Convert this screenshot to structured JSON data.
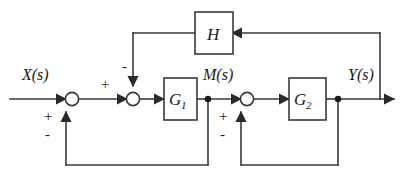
{
  "diagram": {
    "type": "control-system-block-diagram",
    "width": 406,
    "height": 181,
    "background_color": "#ffffff",
    "line_color": "#3a3a3a",
    "text_color": "#1a1a1a"
  },
  "signals": {
    "input": "X(s)",
    "intermediate": "M(s)",
    "output": "Y(s)"
  },
  "blocks": [
    {
      "id": "G1",
      "label": "G",
      "subscript": "1",
      "full_label": "G1"
    },
    {
      "id": "G2",
      "label": "G",
      "subscript": "2",
      "full_label": "G2"
    },
    {
      "id": "H",
      "label": "H",
      "subscript": "",
      "full_label": "H"
    }
  ],
  "summing_junctions": [
    {
      "id": "sum1",
      "inputs": [
        {
          "from": "X(s)",
          "sign": "+",
          "direction": "left"
        },
        {
          "from": "M(s)",
          "sign": "-",
          "direction": "bottom"
        }
      ],
      "sign_top_left": "+",
      "sign_bottom_left": "-"
    },
    {
      "id": "sum2",
      "inputs": [
        {
          "from": "sum1",
          "sign": "+",
          "direction": "left"
        },
        {
          "from": "H",
          "sign": "-",
          "direction": "top"
        }
      ],
      "sign_left": "+",
      "sign_top": "-"
    },
    {
      "id": "sum3",
      "inputs": [
        {
          "from": "M(s)",
          "sign": "+",
          "direction": "left"
        },
        {
          "from": "Y(s)",
          "sign": "-",
          "direction": "bottom"
        }
      ],
      "sign_top_left": "+",
      "sign_bottom_left": "-"
    }
  ],
  "signs": {
    "sum1_forward": "+",
    "sum1_feedback_plus": "+",
    "sum1_feedback_minus": "-",
    "sum2_forward": "+",
    "sum2_top": "-",
    "sum3_feedback_plus": "+",
    "sum3_feedback_minus": "-"
  },
  "branch_nodes": [
    {
      "id": "node_M",
      "signal": "M(s)"
    },
    {
      "id": "node_Y",
      "signal": "Y(s)"
    }
  ],
  "connections": [
    {
      "from": "X(s)",
      "to": "sum1",
      "kind": "forward"
    },
    {
      "from": "sum1",
      "to": "sum2",
      "kind": "forward"
    },
    {
      "from": "sum2",
      "to": "G1",
      "kind": "forward"
    },
    {
      "from": "G1",
      "to": "node_M",
      "kind": "forward"
    },
    {
      "from": "node_M",
      "to": "sum3",
      "kind": "forward"
    },
    {
      "from": "sum3",
      "to": "G2",
      "kind": "forward"
    },
    {
      "from": "G2",
      "to": "node_Y",
      "kind": "forward"
    },
    {
      "from": "node_Y",
      "to": "Y(s)",
      "kind": "output"
    },
    {
      "from": "node_Y",
      "to": "H",
      "kind": "feedback-outer"
    },
    {
      "from": "H",
      "to": "sum2",
      "kind": "feedback-outer"
    },
    {
      "from": "node_M",
      "to": "sum1",
      "kind": "feedback-inner-left"
    },
    {
      "from": "node_Y",
      "to": "sum3",
      "kind": "feedback-inner-right"
    }
  ]
}
